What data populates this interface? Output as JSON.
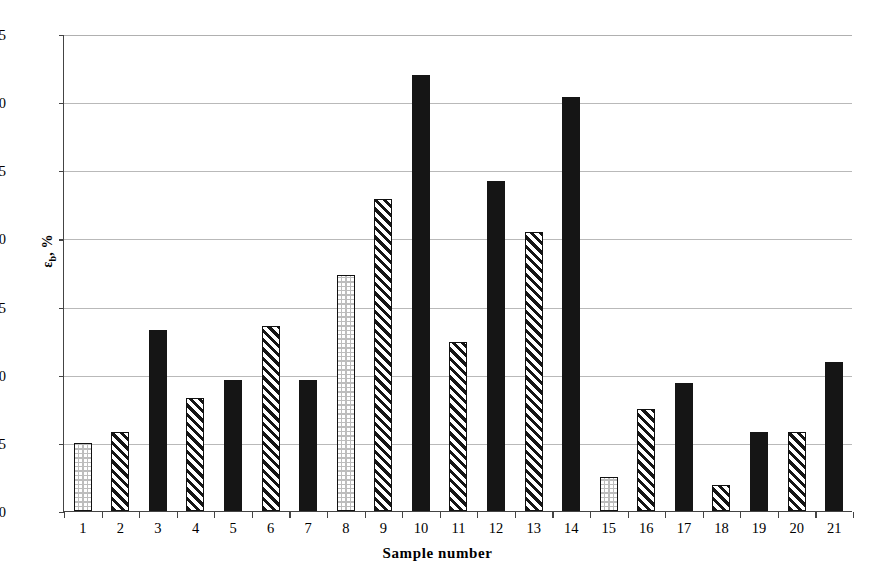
{
  "chart_data": {
    "type": "bar",
    "title": "",
    "xlabel": "Sample number",
    "ylabel_text": "ε",
    "ylabel_sub": "b",
    "ylabel_suffix": ", %",
    "ylabel_full": "εb, %",
    "categories": [
      "1",
      "2",
      "3",
      "4",
      "5",
      "6",
      "7",
      "8",
      "9",
      "10",
      "11",
      "12",
      "13",
      "14",
      "15",
      "16",
      "17",
      "18",
      "19",
      "20",
      "21"
    ],
    "values": [
      5.0,
      5.8,
      13.3,
      8.3,
      9.6,
      13.6,
      9.6,
      17.3,
      22.9,
      32.0,
      12.4,
      24.2,
      20.5,
      30.4,
      2.5,
      7.5,
      9.4,
      1.9,
      5.8,
      5.8,
      10.9
    ],
    "patterns": [
      "dots",
      "hatch",
      "solid",
      "hatch",
      "solid",
      "hatch",
      "solid",
      "dots",
      "hatch",
      "solid",
      "hatch",
      "solid",
      "hatch",
      "solid",
      "dots",
      "hatch",
      "solid",
      "hatch",
      "solid",
      "hatch",
      "solid"
    ],
    "ylim": [
      0,
      35
    ],
    "yticks": [
      0,
      5,
      10,
      15,
      20,
      25,
      30,
      35
    ],
    "ytick_labels": [
      "0",
      "5",
      "10",
      "15",
      "20",
      "25",
      "30",
      "35"
    ],
    "grid": true,
    "grid_axis": "y",
    "legend": "none",
    "colors": {
      "bar_fill": "#151515",
      "bar_edge": "#111111",
      "gridline": "#b9b9b9",
      "axis": "#444444",
      "background": "#ffffff"
    }
  }
}
